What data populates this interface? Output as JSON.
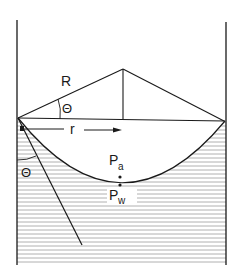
{
  "diagram": {
    "labels": {
      "radius_of_curvature": "R",
      "angle_top": "Θ",
      "tube_radius": "r",
      "contact_angle": "Θ",
      "air_pressure_main": "P",
      "air_pressure_sub": "a",
      "water_pressure_main": "P",
      "water_pressure_sub": "w"
    },
    "colors": {
      "stroke": "#1a1a1a",
      "hatch": "#9a9a9a",
      "background": "#ffffff"
    }
  }
}
